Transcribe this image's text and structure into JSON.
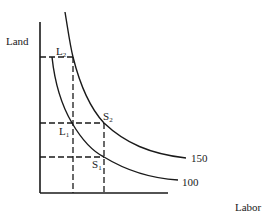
{
  "diagram": {
    "type": "isoquant",
    "axes": {
      "y_label": "Land",
      "x_label": "Labor"
    },
    "curves": [
      {
        "id": "isoquant-150",
        "label": "150"
      },
      {
        "id": "isoquant-100",
        "label": "100"
      }
    ],
    "points": {
      "L2": {
        "main": "L",
        "sub": "2"
      },
      "L1": {
        "main": "L",
        "sub": "1"
      },
      "S2": {
        "main": "S",
        "sub": "2"
      },
      "S1": {
        "main": "S",
        "sub": "1"
      }
    },
    "colors": {
      "ink": "#1a1a1a",
      "background": "#ffffff"
    }
  }
}
